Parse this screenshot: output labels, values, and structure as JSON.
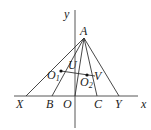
{
  "diagram": {
    "axes": {
      "x_label": "x",
      "y_label": "y"
    },
    "points": {
      "A": "A",
      "X": "X",
      "B": "B",
      "O": "O",
      "C": "C",
      "Y": "Y",
      "O1": "O",
      "O1_sub": "1",
      "O2": "O",
      "O2_sub": "2",
      "U": "U",
      "V": "V"
    },
    "segments": [
      "AX",
      "AB",
      "AO",
      "AC",
      "AY",
      "O1O2"
    ]
  }
}
